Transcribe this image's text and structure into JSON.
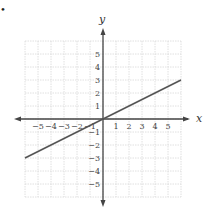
{
  "chart_data": {
    "type": "line",
    "title": "",
    "xlabel": "x",
    "ylabel": "y",
    "xlim": [
      -6,
      6
    ],
    "ylim": [
      -6,
      6
    ],
    "grid": true,
    "x_ticks": [
      "−5",
      "−4",
      "−3",
      "−2",
      "−1",
      "1",
      "2",
      "3",
      "4",
      "5"
    ],
    "y_ticks": [
      "5",
      "4",
      "3",
      "2",
      "1",
      "−1",
      "−2",
      "−3",
      "−4",
      "−5"
    ],
    "series": [
      {
        "name": "y = 0.5x",
        "x": [
          -6,
          6
        ],
        "y": [
          -3,
          3
        ]
      }
    ],
    "line_color": "#555555"
  },
  "labels": {
    "x": "x",
    "y": "y",
    "bullet": "•"
  }
}
